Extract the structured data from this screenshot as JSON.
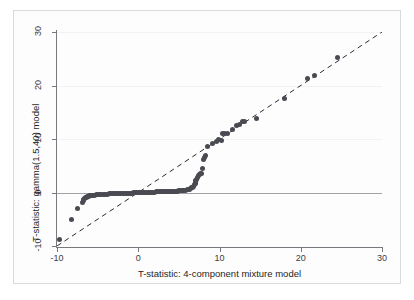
{
  "figure": {
    "width": 414,
    "height": 300,
    "background_color": "#ffffff",
    "frame_color": "#d8dadf"
  },
  "axes": {
    "x_title": "T-statistic: 4-component mixture model",
    "y_title": "T-statistic: gamma(1.5,40) model",
    "x_ticks": [
      "-10",
      "0",
      "10",
      "20",
      "30"
    ],
    "y_ticks": [
      "-10",
      "0",
      "10",
      "20",
      "30"
    ],
    "x_tick_values": [
      -10,
      0,
      10,
      20,
      30
    ],
    "y_tick_values": [
      -10,
      0,
      10,
      20,
      30
    ],
    "axis_color": "#77797f",
    "label_color": "#1f1f22"
  },
  "reference_lines": {
    "identity_label": "identity-line-y-equals-x",
    "identity_style": "dashed",
    "identity_color": "#2b2b2e",
    "zero_label": "horizontal-zero-line",
    "zero_style": "solid",
    "zero_color": "#a0a2a8",
    "gridline_color": "#f1f2f4",
    "gridline_values": [
      10,
      20,
      30
    ]
  },
  "markers": {
    "color": "#4a4a52",
    "shape": "circle",
    "size_px": 5
  },
  "chart_data": {
    "type": "scatter",
    "title": "",
    "subtitle": "",
    "xlabel": "T-statistic: 4-component mixture model",
    "ylabel": "T-statistic: gamma(1.5,40) model",
    "xlim": [
      -10,
      30
    ],
    "ylim": [
      -10,
      30
    ],
    "xticks": [
      -10,
      0,
      10,
      20,
      30
    ],
    "yticks": [
      -10,
      0,
      10,
      20,
      30
    ],
    "grid": true,
    "legend": null,
    "annotations": [],
    "series": [
      {
        "name": "T-statistic pairs",
        "marker": "circle",
        "color": "#4a4a52",
        "points": [
          [
            -9.7,
            -8.7
          ],
          [
            -8.2,
            -5.1
          ],
          [
            -7.5,
            -2.9
          ],
          [
            -6.9,
            -1.9
          ],
          [
            -6.8,
            -1.5
          ],
          [
            -6.7,
            -1.3
          ],
          [
            -6.6,
            -1.1
          ],
          [
            -6.5,
            -1.0
          ],
          [
            -6.4,
            -0.9
          ],
          [
            -6.3,
            -0.8
          ],
          [
            -6.2,
            -0.75
          ],
          [
            -6.1,
            -0.7
          ],
          [
            -6.0,
            -0.65
          ],
          [
            -5.8,
            -0.6
          ],
          [
            -5.6,
            -0.55
          ],
          [
            -5.4,
            -0.5
          ],
          [
            -5.2,
            -0.45
          ],
          [
            -5.0,
            -0.42
          ],
          [
            -4.8,
            -0.4
          ],
          [
            -4.6,
            -0.38
          ],
          [
            -4.4,
            -0.35
          ],
          [
            -4.2,
            -0.33
          ],
          [
            -4.0,
            -0.3
          ],
          [
            -3.8,
            -0.29
          ],
          [
            -3.6,
            -0.28
          ],
          [
            -3.4,
            -0.26
          ],
          [
            -3.2,
            -0.25
          ],
          [
            -3.0,
            -0.24
          ],
          [
            -2.8,
            -0.22
          ],
          [
            -2.6,
            -0.21
          ],
          [
            -2.4,
            -0.2
          ],
          [
            -2.2,
            -0.19
          ],
          [
            -2.0,
            -0.18
          ],
          [
            -1.8,
            -0.17
          ],
          [
            -1.6,
            -0.16
          ],
          [
            -1.4,
            -0.15
          ],
          [
            -1.2,
            -0.13
          ],
          [
            -1.0,
            -0.12
          ],
          [
            -0.8,
            -0.1
          ],
          [
            -0.6,
            -0.08
          ],
          [
            -0.4,
            -0.06
          ],
          [
            -0.2,
            -0.04
          ],
          [
            0.0,
            -0.02
          ],
          [
            0.2,
            0.0
          ],
          [
            0.4,
            0.01
          ],
          [
            0.6,
            0.02
          ],
          [
            0.8,
            0.03
          ],
          [
            1.0,
            0.04
          ],
          [
            1.2,
            0.05
          ],
          [
            1.4,
            0.06
          ],
          [
            1.6,
            0.07
          ],
          [
            1.8,
            0.08
          ],
          [
            2.0,
            0.09
          ],
          [
            2.2,
            0.1
          ],
          [
            2.4,
            0.11
          ],
          [
            2.6,
            0.12
          ],
          [
            2.8,
            0.13
          ],
          [
            3.0,
            0.14
          ],
          [
            3.2,
            0.15
          ],
          [
            3.4,
            0.16
          ],
          [
            3.6,
            0.18
          ],
          [
            3.8,
            0.19
          ],
          [
            4.0,
            0.2
          ],
          [
            4.2,
            0.22
          ],
          [
            4.4,
            0.24
          ],
          [
            4.6,
            0.26
          ],
          [
            4.8,
            0.28
          ],
          [
            5.0,
            0.3
          ],
          [
            5.2,
            0.33
          ],
          [
            5.4,
            0.36
          ],
          [
            5.6,
            0.4
          ],
          [
            5.8,
            0.45
          ],
          [
            6.0,
            0.5
          ],
          [
            6.15,
            0.56
          ],
          [
            6.3,
            0.63
          ],
          [
            6.45,
            0.72
          ],
          [
            6.6,
            0.85
          ],
          [
            6.7,
            1.0
          ],
          [
            6.8,
            1.2
          ],
          [
            6.9,
            1.45
          ],
          [
            7.0,
            1.7
          ],
          [
            7.05,
            1.95
          ],
          [
            7.1,
            2.2
          ],
          [
            7.2,
            2.5
          ],
          [
            7.3,
            2.8
          ],
          [
            7.4,
            3.1
          ],
          [
            7.5,
            3.4
          ],
          [
            7.6,
            3.55
          ],
          [
            7.75,
            3.6
          ],
          [
            7.9,
            4.4
          ],
          [
            8.0,
            6.1
          ],
          [
            8.1,
            6.5
          ],
          [
            8.3,
            6.9
          ],
          [
            8.5,
            8.6
          ],
          [
            9.1,
            9.2
          ],
          [
            9.6,
            9.6
          ],
          [
            9.9,
            9.9
          ],
          [
            10.2,
            9.8
          ],
          [
            10.4,
            11.0
          ],
          [
            10.6,
            11.1
          ],
          [
            11.0,
            11.1
          ],
          [
            11.6,
            11.8
          ],
          [
            12.1,
            12.6
          ],
          [
            12.4,
            12.7
          ],
          [
            12.8,
            13.2
          ],
          [
            13.1,
            13.3
          ],
          [
            14.6,
            13.8
          ],
          [
            18.0,
            17.6
          ],
          [
            20.8,
            21.4
          ],
          [
            21.7,
            21.8
          ],
          [
            24.5,
            25.3
          ]
        ]
      }
    ]
  }
}
